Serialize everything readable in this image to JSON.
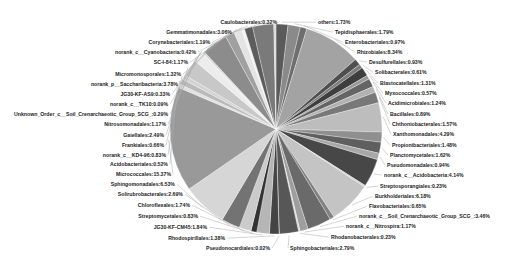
{
  "chart_data": {
    "type": "pie",
    "title": "",
    "center": [
      276,
      129
    ],
    "radius": 106,
    "start_angle_deg": -90,
    "direction": "clockwise",
    "slices": [
      {
        "label": "others",
        "value": 1.73,
        "color": "#5a5a5a",
        "side": "right",
        "lx": 318,
        "ly": 24
      },
      {
        "label": "Tepidisphaerales",
        "value": 1.79,
        "color": "#8a8a8a",
        "side": "right",
        "lx": 335,
        "ly": 34
      },
      {
        "label": "Enterobacteriales",
        "value": 0.97,
        "color": "#6e6e6e",
        "side": "right",
        "lx": 345,
        "ly": 44
      },
      {
        "label": "Rhizobiales",
        "value": 8.34,
        "color": "#a3a3a3",
        "side": "right",
        "lx": 357,
        "ly": 54
      },
      {
        "label": "Desulfurellales",
        "value": 0.93,
        "color": "#4f4f4f",
        "side": "right",
        "lx": 369,
        "ly": 64
      },
      {
        "label": "Solibacterales",
        "value": 0.61,
        "color": "#7d7d7d",
        "side": "right",
        "lx": 375,
        "ly": 74
      },
      {
        "label": "Blastocatellales",
        "value": 1.31,
        "color": "#3e3e3e",
        "side": "right",
        "lx": 380,
        "ly": 85
      },
      {
        "label": "Myxococcales",
        "value": 0.57,
        "color": "#9a9a9a",
        "side": "right",
        "lx": 385,
        "ly": 95
      },
      {
        "label": "Acidimicrobiales",
        "value": 1.24,
        "color": "#656565",
        "side": "right",
        "lx": 388,
        "ly": 105
      },
      {
        "label": "Bacillales",
        "value": 0.89,
        "color": "#b2b2b2",
        "side": "right",
        "lx": 390,
        "ly": 116
      },
      {
        "label": "Chthoniobacterales",
        "value": 1.57,
        "color": "#787878",
        "side": "right",
        "lx": 392,
        "ly": 126
      },
      {
        "label": "Xanthomonadales",
        "value": 4.29,
        "color": "#bdbdbd",
        "side": "right",
        "lx": 393,
        "ly": 136
      },
      {
        "label": "Propionibacteriales",
        "value": 1.48,
        "color": "#8f8f8f",
        "side": "right",
        "lx": 392,
        "ly": 147
      },
      {
        "label": "Planctomycetales",
        "value": 1.62,
        "color": "#5f5f5f",
        "side": "right",
        "lx": 390,
        "ly": 157
      },
      {
        "label": "Pseudomonadales",
        "value": 0.94,
        "color": "#a8a8a8",
        "side": "right",
        "lx": 387,
        "ly": 167
      },
      {
        "label": "norank_c__Acidobacteria",
        "value": 4.14,
        "color": "#474747",
        "side": "right",
        "lx": 384,
        "ly": 177
      },
      {
        "label": "Streptosporangiales",
        "value": 0.23,
        "color": "#cfcfcf",
        "side": "right",
        "lx": 380,
        "ly": 188
      },
      {
        "label": "Burkholderiales",
        "value": 6.18,
        "color": "#c4c4c4",
        "side": "right",
        "lx": 375,
        "ly": 198
      },
      {
        "label": "Flavobacteriales",
        "value": 0.65,
        "color": "#828282",
        "side": "right",
        "lx": 369,
        "ly": 208
      },
      {
        "label": "norank_c__Soil_Crenarchaeotic_Group_SCG_",
        "value": 3.46,
        "color": "#6a6a6a",
        "side": "right",
        "lx": 359,
        "ly": 218
      },
      {
        "label": "norank_c__Nitrospira",
        "value": 1.17,
        "color": "#9e9e9e",
        "side": "right",
        "lx": 346,
        "ly": 228
      },
      {
        "label": "Rhodanobacterales",
        "value": 0.23,
        "color": "#dadada",
        "side": "right",
        "lx": 331,
        "ly": 239
      },
      {
        "label": "Sphingobacteriales",
        "value": 2.79,
        "color": "#575757",
        "side": "right",
        "lx": 290,
        "ly": 250
      },
      {
        "label": "Pseudonocardiales",
        "value": 0.02,
        "color": "#d0d0d0",
        "side": "left",
        "lx": 270,
        "ly": 250
      },
      {
        "label": "Rhodospirillales",
        "value": 1.38,
        "color": "#444444",
        "side": "left",
        "lx": 225,
        "ly": 240
      },
      {
        "label": "JG30-KF-CM45",
        "value": 1.84,
        "color": "#b6b6b6",
        "side": "left",
        "lx": 207,
        "ly": 229
      },
      {
        "label": "Streptomycetales",
        "value": 0.83,
        "color": "#333333",
        "side": "left",
        "lx": 198,
        "ly": 218
      },
      {
        "label": "Chloroflexales",
        "value": 1.74,
        "color": "#cbcbcb",
        "side": "left",
        "lx": 190,
        "ly": 207
      },
      {
        "label": "Solirubrobacterales",
        "value": 2.69,
        "color": "#737373",
        "side": "left",
        "lx": 183,
        "ly": 196
      },
      {
        "label": "Sphingomonadales",
        "value": 6.53,
        "color": "#d6d6d6",
        "side": "left",
        "lx": 175,
        "ly": 186
      },
      {
        "label": "Micrococcales",
        "value": 15.37,
        "color": "#999999",
        "side": "left",
        "lx": 171,
        "ly": 176
      },
      {
        "label": "Acidobacteriales",
        "value": 0.52,
        "color": "#e0e0e0",
        "side": "left",
        "lx": 168,
        "ly": 166
      },
      {
        "label": "norank_c__KD4-96",
        "value": 0.83,
        "color": "#bababa",
        "side": "left",
        "lx": 166,
        "ly": 157
      },
      {
        "label": "Frankiales",
        "value": 0.66,
        "color": "#d3d3d3",
        "side": "left",
        "lx": 164,
        "ly": 147
      },
      {
        "label": "Gaiellales",
        "value": 2.49,
        "color": "#c8c8c8",
        "side": "left",
        "lx": 164,
        "ly": 137
      },
      {
        "label": "Nitrosomonadales",
        "value": 1.17,
        "color": "#ececec",
        "side": "left",
        "lx": 166,
        "ly": 126
      },
      {
        "label": "Unknown_Order_c__Soil_Crenarchaeotic_Group_SCG_",
        "value": 0.29,
        "color": "#e6e6e6",
        "side": "left",
        "lx": 168,
        "ly": 116
      },
      {
        "label": "norank_c__TK10",
        "value": 0.09,
        "color": "#f0f0f0",
        "side": "left",
        "lx": 168,
        "ly": 106
      },
      {
        "label": "JG30-KF-AS9",
        "value": 0.33,
        "color": "#dcdcdc",
        "side": "left",
        "lx": 170,
        "ly": 96
      },
      {
        "label": "norank_p__Saccharibacteria",
        "value": 3.78,
        "color": "#8c8c8c",
        "side": "left",
        "lx": 178,
        "ly": 86
      },
      {
        "label": "Micromonosporales",
        "value": 1.32,
        "color": "#a0a0a0",
        "side": "left",
        "lx": 181,
        "ly": 76
      },
      {
        "label": "SC-I-84",
        "value": 1.17,
        "color": "#e4e4e4",
        "side": "left",
        "lx": 188,
        "ly": 64
      },
      {
        "label": "norank_c__Cyanobacteria",
        "value": 0.42,
        "color": "#f2f2f2",
        "side": "left",
        "lx": 196,
        "ly": 54
      },
      {
        "label": "Corynebacteriales",
        "value": 1.19,
        "color": "#5c5c5c",
        "side": "left",
        "lx": 210,
        "ly": 44
      },
      {
        "label": "Gemmatimonadales",
        "value": 3.06,
        "color": "#7a7a7a",
        "side": "left",
        "lx": 232,
        "ly": 34
      },
      {
        "label": "Caulobacterales",
        "value": 0.32,
        "color": "#d8d8d8",
        "side": "left",
        "lx": 277,
        "ly": 24
      }
    ]
  }
}
